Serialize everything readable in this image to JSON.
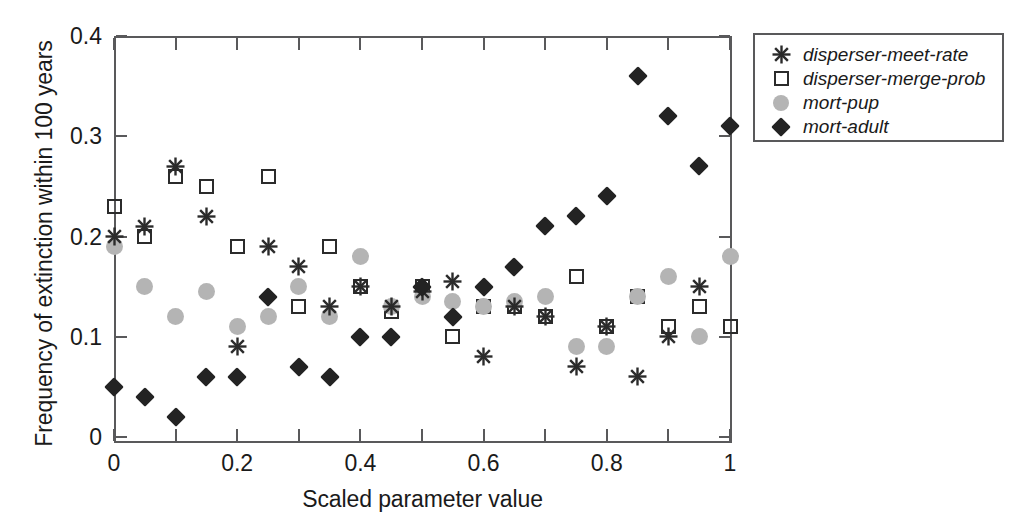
{
  "chart_data": {
    "type": "scatter",
    "title": "",
    "xlabel": "Scaled parameter value",
    "ylabel": "Frequency of extinction within 100 years",
    "xlim": [
      0,
      1
    ],
    "ylim": [
      0,
      0.4
    ],
    "grid": false,
    "legend_position": "outside-top-right",
    "x_ticks": [
      0,
      0.1,
      0.2,
      0.3,
      0.4,
      0.5,
      0.6,
      0.7,
      0.8,
      0.9,
      1
    ],
    "x_tick_labels": [
      "0",
      "",
      "0.2",
      "",
      "0.4",
      "",
      "0.6",
      "",
      "0.8",
      "",
      "1"
    ],
    "y_ticks": [
      0,
      0.1,
      0.2,
      0.3,
      0.4
    ],
    "y_tick_labels": [
      "0",
      "0.1",
      "0.2",
      "0.3",
      "0.4"
    ],
    "x": [
      0,
      0.05,
      0.1,
      0.15,
      0.2,
      0.25,
      0.3,
      0.35,
      0.4,
      0.45,
      0.5,
      0.55,
      0.6,
      0.65,
      0.7,
      0.75,
      0.8,
      0.85,
      0.9,
      0.95,
      1
    ],
    "series": [
      {
        "name": "disperser-meet-rate",
        "marker": "star",
        "color": "#2b2b2b",
        "values": [
          0.2,
          0.21,
          0.27,
          0.22,
          0.09,
          0.19,
          0.17,
          0.13,
          0.15,
          0.13,
          0.145,
          0.155,
          0.08,
          0.13,
          0.12,
          0.07,
          0.11,
          0.06,
          0.1,
          0.15,
          null
        ]
      },
      {
        "name": "disperser-merge-prob",
        "marker": "square",
        "color": "#2b2b2b",
        "values": [
          0.23,
          0.2,
          0.26,
          0.25,
          0.19,
          0.26,
          0.13,
          0.19,
          0.15,
          0.125,
          0.15,
          0.1,
          0.13,
          0.13,
          0.12,
          0.16,
          0.11,
          0.14,
          0.11,
          0.13,
          0.11
        ]
      },
      {
        "name": "mort-pup",
        "marker": "circle",
        "color": "#b4b4b4",
        "values": [
          0.19,
          0.15,
          0.12,
          0.145,
          0.11,
          0.12,
          0.15,
          0.12,
          0.18,
          0.13,
          0.14,
          0.135,
          0.13,
          0.135,
          0.14,
          0.09,
          0.09,
          0.14,
          0.16,
          0.1,
          0.18
        ]
      },
      {
        "name": "mort-adult",
        "marker": "diamond",
        "color": "#232323",
        "values": [
          0.05,
          0.04,
          0.02,
          0.06,
          0.06,
          0.14,
          0.07,
          0.06,
          0.1,
          0.1,
          0.15,
          0.12,
          0.15,
          0.17,
          0.21,
          0.22,
          0.24,
          0.36,
          0.32,
          0.27,
          0.31
        ]
      }
    ]
  },
  "legend": {
    "items": [
      {
        "label": "disperser-meet-rate",
        "marker": "star"
      },
      {
        "label": "disperser-merge-prob",
        "marker": "square"
      },
      {
        "label": "mort-pup",
        "marker": "circle"
      },
      {
        "label": "mort-adult",
        "marker": "diamond"
      }
    ]
  }
}
